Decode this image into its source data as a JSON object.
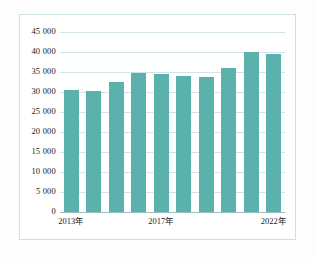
{
  "figure": {
    "background_color": "#ffffff",
    "frame_color": "#cfe0e4",
    "bar_color": "#5bb2ad",
    "gridline_color": "#d3e3e7"
  },
  "chart_data": {
    "type": "bar",
    "title": "",
    "subtitle": "",
    "xlabel": "",
    "ylabel": "",
    "categories": [
      "2013年",
      "2014年",
      "2015年",
      "2016年",
      "2017年",
      "2018年",
      "2019年",
      "2020年",
      "2021年",
      "2022年"
    ],
    "values": [
      30500,
      30300,
      32400,
      34700,
      34600,
      34100,
      33700,
      35900,
      40000,
      39600
    ],
    "ylim": [
      0,
      45000
    ],
    "ytick_values": [
      0,
      5000,
      10000,
      15000,
      20000,
      25000,
      30000,
      35000,
      40000,
      45000
    ],
    "ytick_labels": [
      "0",
      "5 000",
      "10 000",
      "15 000",
      "20 000",
      "25 000",
      "30 000",
      "35 000",
      "40 000",
      "45 000"
    ],
    "xtick_labels": [
      "2013年",
      "2017年",
      "2022年"
    ],
    "xtick_indices": [
      0,
      4,
      9
    ],
    "grid": true,
    "grid_axis": "y",
    "legend": null,
    "legend_position": "none",
    "annotations": []
  }
}
